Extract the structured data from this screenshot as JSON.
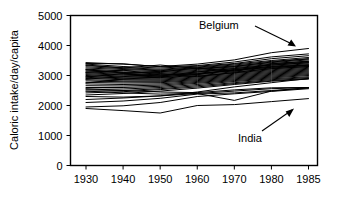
{
  "chart_data": {
    "type": "line",
    "title": "",
    "xlabel": "",
    "ylabel": "Caloric intake/day/capita",
    "x": [
      1930,
      1940,
      1950,
      1960,
      1970,
      1980,
      1985
    ],
    "xtick_labels": [
      "1930",
      "1940",
      "1950",
      "1960",
      "1970",
      "1980",
      "1985"
    ],
    "ytick_labels": [
      "0",
      "1000",
      "2000",
      "3000",
      "4000",
      "5000"
    ],
    "yticks": [
      0,
      1000,
      2000,
      3000,
      4000,
      5000
    ],
    "ylim": [
      0,
      5000
    ],
    "grid": false,
    "legend": "none",
    "axis_spacing": "categorical-even",
    "series": [
      {
        "name": "Belgium",
        "values": [
          3430,
          3380,
          3300,
          3380,
          3520,
          3760,
          3900
        ]
      },
      {
        "name": "India",
        "values": [
          1900,
          1830,
          1750,
          2000,
          2030,
          2130,
          2230
        ]
      },
      {
        "name": "Country 3",
        "values": [
          3400,
          3390,
          3290,
          3330,
          3450,
          3620,
          3720
        ]
      },
      {
        "name": "Country 4",
        "values": [
          3380,
          3300,
          3250,
          3310,
          3400,
          3560,
          3660
        ]
      },
      {
        "name": "Country 5",
        "values": [
          3330,
          3260,
          3210,
          3280,
          3380,
          3500,
          3600
        ]
      },
      {
        "name": "Country 6",
        "values": [
          3290,
          3230,
          3180,
          3260,
          3350,
          3470,
          3560
        ]
      },
      {
        "name": "Country 7",
        "values": [
          3250,
          3200,
          3160,
          3230,
          3320,
          3430,
          3520
        ]
      },
      {
        "name": "Country 8",
        "values": [
          3210,
          3160,
          3130,
          3200,
          3290,
          3400,
          3480
        ]
      },
      {
        "name": "Country 9",
        "values": [
          3180,
          3120,
          3100,
          3170,
          3260,
          3370,
          3450
        ]
      },
      {
        "name": "Country 10",
        "values": [
          3150,
          3100,
          3070,
          3140,
          3230,
          3340,
          3420
        ]
      },
      {
        "name": "Country 11",
        "values": [
          3120,
          3070,
          3040,
          3110,
          3200,
          3310,
          3390
        ]
      },
      {
        "name": "Country 12",
        "values": [
          3090,
          3040,
          3010,
          3080,
          3170,
          3280,
          3360
        ]
      },
      {
        "name": "Country 13",
        "values": [
          3060,
          3010,
          2990,
          3060,
          3150,
          3250,
          3330
        ]
      },
      {
        "name": "Country 14",
        "values": [
          3030,
          2980,
          2960,
          3030,
          3120,
          3220,
          3300
        ]
      },
      {
        "name": "Country 15",
        "values": [
          3000,
          2950,
          2930,
          3000,
          3090,
          3190,
          3270
        ]
      },
      {
        "name": "Country 16",
        "values": [
          2970,
          2920,
          2910,
          2980,
          3070,
          3160,
          3240
        ]
      },
      {
        "name": "Country 17",
        "values": [
          2940,
          2890,
          2880,
          2950,
          3040,
          3130,
          3210
        ]
      },
      {
        "name": "Country 18",
        "values": [
          2900,
          2860,
          2850,
          2920,
          3010,
          3100,
          3180
        ]
      },
      {
        "name": "Country 19",
        "values": [
          2860,
          2820,
          2820,
          2890,
          2980,
          3070,
          3150
        ]
      },
      {
        "name": "Country 20",
        "values": [
          2820,
          2790,
          2790,
          2860,
          2950,
          3040,
          3120
        ]
      },
      {
        "name": "Country 21",
        "values": [
          2770,
          2750,
          2760,
          2830,
          2920,
          3010,
          3090
        ]
      },
      {
        "name": "Country 22",
        "values": [
          2720,
          2700,
          2720,
          2800,
          2890,
          2980,
          3060
        ]
      },
      {
        "name": "Country 23",
        "values": [
          2660,
          2650,
          2680,
          2770,
          2860,
          2950,
          3030
        ]
      },
      {
        "name": "Country 24",
        "values": [
          2600,
          2600,
          2640,
          2740,
          2830,
          2920,
          3000
        ]
      },
      {
        "name": "Country 25",
        "values": [
          2540,
          2550,
          2600,
          2700,
          2800,
          2890,
          2960
        ]
      },
      {
        "name": "Country 26",
        "values": [
          2480,
          2500,
          2560,
          2660,
          2760,
          2860,
          2930
        ]
      },
      {
        "name": "Country 27",
        "values": [
          2420,
          2460,
          2530,
          2620,
          2730,
          2830,
          2900
        ]
      },
      {
        "name": "Country 28",
        "values": [
          2350,
          2400,
          2480,
          2580,
          2700,
          2810,
          2880
        ]
      },
      {
        "name": "Country 29",
        "values": [
          2560,
          2500,
          2450,
          2430,
          2520,
          2590,
          2600
        ]
      },
      {
        "name": "Country 30",
        "values": [
          2480,
          2420,
          2380,
          2400,
          2480,
          2560,
          2600
        ]
      },
      {
        "name": "Country 31",
        "values": [
          2200,
          2250,
          2320,
          2400,
          2170,
          2480,
          2600
        ]
      },
      {
        "name": "Country 32",
        "values": [
          2100,
          2150,
          2240,
          2380,
          2420,
          2500,
          2580
        ]
      },
      {
        "name": "Country 33",
        "values": [
          1950,
          1990,
          2100,
          2300,
          2390,
          2470,
          2560
        ]
      },
      {
        "name": "Country 34",
        "values": [
          2300,
          2280,
          2320,
          2450,
          2620,
          2760,
          2900
        ]
      },
      {
        "name": "Country 35",
        "values": [
          3100,
          3180,
          3020,
          3050,
          3190,
          3300,
          3350
        ]
      },
      {
        "name": "Country 36",
        "values": [
          3350,
          3250,
          3350,
          3230,
          3300,
          3450,
          3550
        ]
      },
      {
        "name": "Country 37",
        "values": [
          2950,
          3060,
          2980,
          3120,
          3230,
          3350,
          3430
        ]
      },
      {
        "name": "Country 38",
        "values": [
          2750,
          2880,
          2950,
          3040,
          3180,
          3270,
          3340
        ]
      },
      {
        "name": "Country 39",
        "values": [
          3200,
          3080,
          3120,
          3250,
          3140,
          3390,
          3470
        ]
      },
      {
        "name": "Country 40",
        "values": [
          2880,
          2960,
          3060,
          2960,
          3100,
          3230,
          3300
        ]
      }
    ],
    "annotations": [
      {
        "label": "Belgium",
        "target_series": "Belgium",
        "arrow_direction": "down-right"
      },
      {
        "label": "India",
        "target_series": "India",
        "arrow_direction": "up-right"
      }
    ]
  }
}
